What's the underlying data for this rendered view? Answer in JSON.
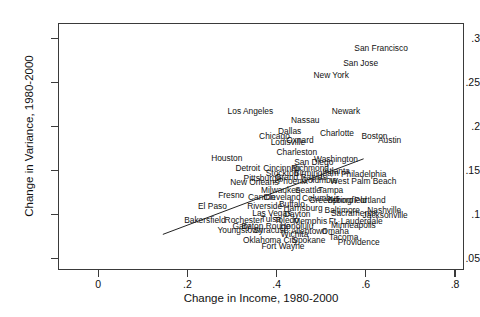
{
  "chart_data": {
    "type": "scatter",
    "title": "",
    "xlabel": "Change in Income, 1980-2000",
    "ylabel": "Change in Variance, 1980-2000",
    "xlim": [
      -0.09,
      0.82
    ],
    "ylim": [
      0.037,
      0.318
    ],
    "xticks": [
      0,
      0.2,
      0.4,
      0.6,
      0.8
    ],
    "xtick_labels": [
      "0",
      ".2",
      ".4",
      ".6",
      ".8"
    ],
    "yticks": [
      0.05,
      0.1,
      0.15,
      0.2,
      0.25,
      0.3
    ],
    "ytick_labels": [
      ".05",
      ".1",
      ".15",
      ".2",
      ".25",
      ".3"
    ],
    "grid": false,
    "legend": null,
    "marker_style": "text-label",
    "fit_line": {
      "visible": true,
      "x_start": 0.145,
      "y_start": 0.0775,
      "x_end": 0.595,
      "y_end": 0.1635
    },
    "points": [
      {
        "label": "San Francisco",
        "x": 0.632,
        "y": 0.2905
      },
      {
        "label": "San Jose",
        "x": 0.586,
        "y": 0.2735
      },
      {
        "label": "New York",
        "x": 0.52,
        "y": 0.2605
      },
      {
        "label": "Los Angeles",
        "x": 0.339,
        "y": 0.2195
      },
      {
        "label": "Newark",
        "x": 0.553,
        "y": 0.219
      },
      {
        "label": "Nassau",
        "x": 0.462,
        "y": 0.2085
      },
      {
        "label": "Dallas",
        "x": 0.427,
        "y": 0.1965
      },
      {
        "label": "Charlotte",
        "x": 0.533,
        "y": 0.1945
      },
      {
        "label": "Boston",
        "x": 0.617,
        "y": 0.191
      },
      {
        "label": "Chicago",
        "x": 0.393,
        "y": 0.1905
      },
      {
        "label": "Oxnard",
        "x": 0.45,
        "y": 0.1865
      },
      {
        "label": "Austin",
        "x": 0.651,
        "y": 0.1855
      },
      {
        "label": "Louisville",
        "x": 0.423,
        "y": 0.1835
      },
      {
        "label": "Charleston",
        "x": 0.443,
        "y": 0.1725
      },
      {
        "label": "Houston",
        "x": 0.286,
        "y": 0.1655
      },
      {
        "label": "Washington",
        "x": 0.531,
        "y": 0.164
      },
      {
        "label": "San Diego",
        "x": 0.481,
        "y": 0.1615
      },
      {
        "label": "Detroit",
        "x": 0.333,
        "y": 0.154
      },
      {
        "label": "Cincinnati",
        "x": 0.409,
        "y": 0.154
      },
      {
        "label": "Richmond",
        "x": 0.473,
        "y": 0.154
      },
      {
        "label": "Atlanta",
        "x": 0.533,
        "y": 0.151
      },
      {
        "label": "Stockton",
        "x": 0.41,
        "y": 0.1485
      },
      {
        "label": "Birmingham",
        "x": 0.487,
        "y": 0.149
      },
      {
        "label": "Philadelphia",
        "x": 0.593,
        "y": 0.147
      },
      {
        "label": "Pittsburgh",
        "x": 0.366,
        "y": 0.143
      },
      {
        "label": "Grand Rapids",
        "x": 0.452,
        "y": 0.1435
      },
      {
        "label": "Columbia",
        "x": 0.494,
        "y": 0.14
      },
      {
        "label": "West Palm Beach",
        "x": 0.592,
        "y": 0.1395
      },
      {
        "label": "New Orleans",
        "x": 0.348,
        "y": 0.1385
      },
      {
        "label": "Phoenix",
        "x": 0.434,
        "y": 0.139
      },
      {
        "label": "Milwaukee",
        "x": 0.407,
        "y": 0.1295
      },
      {
        "label": "Seattle",
        "x": 0.468,
        "y": 0.1295
      },
      {
        "label": "Tampa",
        "x": 0.519,
        "y": 0.129
      },
      {
        "label": "Fresno",
        "x": 0.296,
        "y": 0.1235
      },
      {
        "label": "Canton",
        "x": 0.364,
        "y": 0.1215
      },
      {
        "label": "Cleveland",
        "x": 0.41,
        "y": 0.1215
      },
      {
        "label": "Columbus",
        "x": 0.497,
        "y": 0.12
      },
      {
        "label": "Greensboro",
        "x": 0.52,
        "y": 0.1175
      },
      {
        "label": "Springfield",
        "x": 0.556,
        "y": 0.1175
      },
      {
        "label": "Portland",
        "x": 0.607,
        "y": 0.1175
      },
      {
        "label": "El Paso",
        "x": 0.254,
        "y": 0.1105
      },
      {
        "label": "Riverside",
        "x": 0.371,
        "y": 0.1105
      },
      {
        "label": "Buffalo",
        "x": 0.432,
        "y": 0.113
      },
      {
        "label": "Harrisburg",
        "x": 0.457,
        "y": 0.1085
      },
      {
        "label": "Baltimore",
        "x": 0.545,
        "y": 0.106
      },
      {
        "label": "Nashville",
        "x": 0.639,
        "y": 0.106
      },
      {
        "label": "Las Vegas",
        "x": 0.387,
        "y": 0.1035
      },
      {
        "label": "Dayton",
        "x": 0.444,
        "y": 0.102
      },
      {
        "label": "Sacramento",
        "x": 0.57,
        "y": 0.1035
      },
      {
        "label": "Jacksonville",
        "x": 0.641,
        "y": 0.101
      },
      {
        "label": "Bakersfield",
        "x": 0.237,
        "y": 0.0955
      },
      {
        "label": "Rochester",
        "x": 0.324,
        "y": 0.0945
      },
      {
        "label": "Tulsa",
        "x": 0.385,
        "y": 0.096
      },
      {
        "label": "Toledo",
        "x": 0.42,
        "y": 0.0945
      },
      {
        "label": "Memphis",
        "x": 0.473,
        "y": 0.094
      },
      {
        "label": "Ft. Lauderdale",
        "x": 0.575,
        "y": 0.094
      },
      {
        "label": "Gary",
        "x": 0.319,
        "y": 0.0885
      },
      {
        "label": "Baton Rouge",
        "x": 0.374,
        "y": 0.088
      },
      {
        "label": "Honolulu",
        "x": 0.443,
        "y": 0.088
      },
      {
        "label": "Minneapolis",
        "x": 0.57,
        "y": 0.0895
      },
      {
        "label": "Youngstown",
        "x": 0.316,
        "y": 0.0835
      },
      {
        "label": "Syracuse",
        "x": 0.385,
        "y": 0.0835
      },
      {
        "label": "Allentown",
        "x": 0.47,
        "y": 0.083
      },
      {
        "label": "Omaha",
        "x": 0.529,
        "y": 0.0825
      },
      {
        "label": "Wichita",
        "x": 0.438,
        "y": 0.079
      },
      {
        "label": "Tacoma",
        "x": 0.548,
        "y": 0.076
      },
      {
        "label": "Oklahoma City",
        "x": 0.384,
        "y": 0.072
      },
      {
        "label": "Spokane",
        "x": 0.47,
        "y": 0.072
      },
      {
        "label": "Providence",
        "x": 0.582,
        "y": 0.07
      },
      {
        "label": "Fort Wayne",
        "x": 0.412,
        "y": 0.066
      }
    ]
  }
}
